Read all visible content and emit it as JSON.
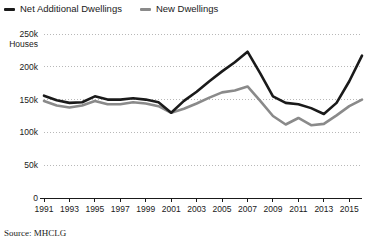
{
  "legend": {
    "position": "top-left",
    "items": [
      {
        "label": "Net Additional Dwellings",
        "color": "#1a1a1a",
        "icon": "line-swatch-icon"
      },
      {
        "label": "New Dwellings",
        "color": "#8a8a8a",
        "icon": "line-swatch-icon"
      }
    ]
  },
  "axis": {
    "y_unit_label": "Houses",
    "y_ticks": [
      "0",
      "50k",
      "100k",
      "150k",
      "200k",
      "250k"
    ],
    "x_ticks": [
      "1991",
      "1993",
      "1995",
      "1997",
      "1999",
      "2001",
      "2003",
      "2005",
      "2007",
      "2009",
      "2011",
      "2013",
      "2015"
    ]
  },
  "source": {
    "text": "Source: MHCLG"
  },
  "colors": {
    "net_additional": "#1a1a1a",
    "new_dwellings": "#8a8a8a",
    "gridline": "#b8b8b8",
    "axis": "#1a1a1a",
    "background": "#ffffff"
  },
  "chart_data": {
    "type": "line",
    "title": "",
    "subtitle": "",
    "xlabel": "",
    "ylabel": "Houses",
    "ylim": [
      0,
      250000
    ],
    "xlim": [
      1991,
      2016
    ],
    "grid": true,
    "legend_position": "top-left",
    "y_tick_values": [
      0,
      50000,
      100000,
      150000,
      200000,
      250000
    ],
    "y_tick_labels": [
      "0",
      "50k",
      "100k",
      "150k",
      "200k",
      "250k"
    ],
    "x_tick_values": [
      1991,
      1993,
      1995,
      1997,
      1999,
      2001,
      2003,
      2005,
      2007,
      2009,
      2011,
      2013,
      2015
    ],
    "x": [
      1991,
      1992,
      1993,
      1994,
      1995,
      1996,
      1997,
      1998,
      1999,
      2000,
      2001,
      2002,
      2003,
      2004,
      2005,
      2006,
      2007,
      2008,
      2009,
      2010,
      2011,
      2012,
      2013,
      2014,
      2015,
      2016
    ],
    "series": [
      {
        "name": "Net Additional Dwellings",
        "color": "#1a1a1a",
        "values": [
          156000,
          149000,
          145000,
          146000,
          155000,
          150000,
          150000,
          152000,
          150000,
          146000,
          130000,
          148000,
          162000,
          178000,
          193000,
          207000,
          223000,
          190000,
          155000,
          145000,
          143000,
          137000,
          128000,
          145000,
          178000,
          217000
        ]
      },
      {
        "name": "New Dwellings",
        "color": "#8a8a8a",
        "values": [
          148000,
          141000,
          138000,
          141000,
          148000,
          143000,
          143000,
          146000,
          144000,
          140000,
          130000,
          136000,
          144000,
          153000,
          161000,
          164000,
          170000,
          148000,
          125000,
          112000,
          122000,
          111000,
          113000,
          126000,
          140000,
          150000
        ]
      }
    ]
  }
}
